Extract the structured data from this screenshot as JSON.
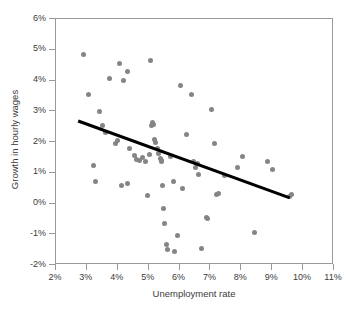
{
  "chart_data": {
    "type": "scatter",
    "title": "",
    "xlabel": "Unemployment rate",
    "ylabel": "Growth in hourly wages",
    "xlim": [
      2,
      11
    ],
    "ylim": [
      -2,
      6
    ],
    "xtick_labels": [
      "2%",
      "3%",
      "4%",
      "5%",
      "6%",
      "7%",
      "8%",
      "9%",
      "10%",
      "11%"
    ],
    "xticks": [
      2,
      3,
      4,
      5,
      6,
      7,
      8,
      9,
      10,
      11
    ],
    "ytick_labels": [
      "-2%",
      "-1%",
      "0%",
      "1%",
      "2%",
      "3%",
      "4%",
      "5%",
      "6%"
    ],
    "yticks": [
      -2,
      -1,
      0,
      1,
      2,
      3,
      4,
      5,
      6
    ],
    "grid": false,
    "legend": null,
    "marker_color": "#858585",
    "marker_size": 5,
    "trendline": {
      "color": "#000000",
      "width": 3,
      "x_start": 2.75,
      "y_start": 2.65,
      "x_end": 9.6,
      "y_end": 0.15
    },
    "points": [
      {
        "x": 2.88,
        "y": 4.85
      },
      {
        "x": 3.05,
        "y": 3.55
      },
      {
        "x": 3.22,
        "y": 1.25
      },
      {
        "x": 3.28,
        "y": 0.7
      },
      {
        "x": 3.4,
        "y": 3.0
      },
      {
        "x": 3.5,
        "y": 2.55
      },
      {
        "x": 3.6,
        "y": 2.3
      },
      {
        "x": 3.72,
        "y": 4.05
      },
      {
        "x": 3.92,
        "y": 1.95
      },
      {
        "x": 4.0,
        "y": 2.05
      },
      {
        "x": 4.05,
        "y": 4.55
      },
      {
        "x": 4.12,
        "y": 0.6
      },
      {
        "x": 4.18,
        "y": 4.0
      },
      {
        "x": 4.3,
        "y": 4.3
      },
      {
        "x": 4.32,
        "y": 0.65
      },
      {
        "x": 4.38,
        "y": 1.8
      },
      {
        "x": 4.55,
        "y": 1.55
      },
      {
        "x": 4.62,
        "y": 1.42
      },
      {
        "x": 4.7,
        "y": 1.4
      },
      {
        "x": 4.8,
        "y": 1.48
      },
      {
        "x": 4.9,
        "y": 1.38
      },
      {
        "x": 4.95,
        "y": 0.25
      },
      {
        "x": 5.02,
        "y": 1.6
      },
      {
        "x": 5.05,
        "y": 4.65
      },
      {
        "x": 5.1,
        "y": 2.55
      },
      {
        "x": 5.12,
        "y": 2.62
      },
      {
        "x": 5.15,
        "y": 2.58
      },
      {
        "x": 5.18,
        "y": 2.08
      },
      {
        "x": 5.22,
        "y": 2.0
      },
      {
        "x": 5.28,
        "y": 1.78
      },
      {
        "x": 5.32,
        "y": 1.62
      },
      {
        "x": 5.38,
        "y": 1.45
      },
      {
        "x": 5.4,
        "y": 1.4
      },
      {
        "x": 5.42,
        "y": 1.35
      },
      {
        "x": 5.45,
        "y": 0.6
      },
      {
        "x": 5.48,
        "y": -0.15
      },
      {
        "x": 5.52,
        "y": -0.65
      },
      {
        "x": 5.58,
        "y": -1.32
      },
      {
        "x": 5.62,
        "y": -1.5
      },
      {
        "x": 5.7,
        "y": 1.52
      },
      {
        "x": 5.8,
        "y": 0.72
      },
      {
        "x": 5.85,
        "y": -1.55
      },
      {
        "x": 5.92,
        "y": -1.05
      },
      {
        "x": 6.02,
        "y": 3.85
      },
      {
        "x": 6.1,
        "y": 0.48
      },
      {
        "x": 6.22,
        "y": 2.25
      },
      {
        "x": 6.4,
        "y": 3.55
      },
      {
        "x": 6.45,
        "y": 1.38
      },
      {
        "x": 6.52,
        "y": 1.18
      },
      {
        "x": 6.58,
        "y": 1.3
      },
      {
        "x": 6.62,
        "y": 0.95
      },
      {
        "x": 6.72,
        "y": -1.45
      },
      {
        "x": 6.88,
        "y": -0.45
      },
      {
        "x": 6.92,
        "y": -0.48
      },
      {
        "x": 7.02,
        "y": 3.05
      },
      {
        "x": 7.12,
        "y": 1.95
      },
      {
        "x": 7.2,
        "y": 0.3
      },
      {
        "x": 7.25,
        "y": 0.32
      },
      {
        "x": 7.45,
        "y": 0.9
      },
      {
        "x": 7.88,
        "y": 1.18
      },
      {
        "x": 8.05,
        "y": 1.52
      },
      {
        "x": 8.42,
        "y": -0.95
      },
      {
        "x": 8.85,
        "y": 1.35
      },
      {
        "x": 9.02,
        "y": 1.12
      },
      {
        "x": 9.55,
        "y": 0.22
      },
      {
        "x": 9.62,
        "y": 0.28
      }
    ]
  },
  "axes": {
    "x_title": "Unemployment rate",
    "y_title": "Growth in hourly wages"
  }
}
